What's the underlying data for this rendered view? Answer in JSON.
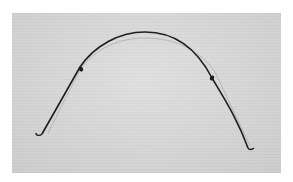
{
  "image": {
    "subject": "orthodontic archwire",
    "background_color": "#d2d2d2",
    "border_color": "#ffffff",
    "wire_color": "#1e1e1e"
  }
}
